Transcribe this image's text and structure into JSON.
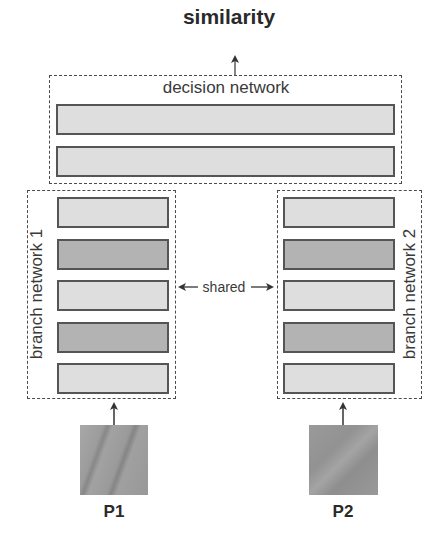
{
  "output": {
    "label": "similarity"
  },
  "decision_network": {
    "label": "decision network",
    "layers": [
      {
        "shade": "light"
      },
      {
        "shade": "light"
      }
    ]
  },
  "branches": [
    {
      "label": "branch network 1",
      "layers": [
        {
          "shade": "light"
        },
        {
          "shade": "dark"
        },
        {
          "shade": "light"
        },
        {
          "shade": "dark"
        },
        {
          "shade": "light"
        }
      ],
      "input": {
        "label": "P1"
      }
    },
    {
      "label": "branch network 2",
      "layers": [
        {
          "shade": "light"
        },
        {
          "shade": "dark"
        },
        {
          "shade": "light"
        },
        {
          "shade": "dark"
        },
        {
          "shade": "light"
        }
      ],
      "input": {
        "label": "P2"
      }
    }
  ],
  "shared_link": {
    "label": "shared"
  },
  "colors": {
    "light_layer": "#dedede",
    "dark_layer": "#b3b3b3",
    "layer_border": "#555555",
    "dash": "#4a4a4a",
    "patch": "#9a9a9a"
  }
}
